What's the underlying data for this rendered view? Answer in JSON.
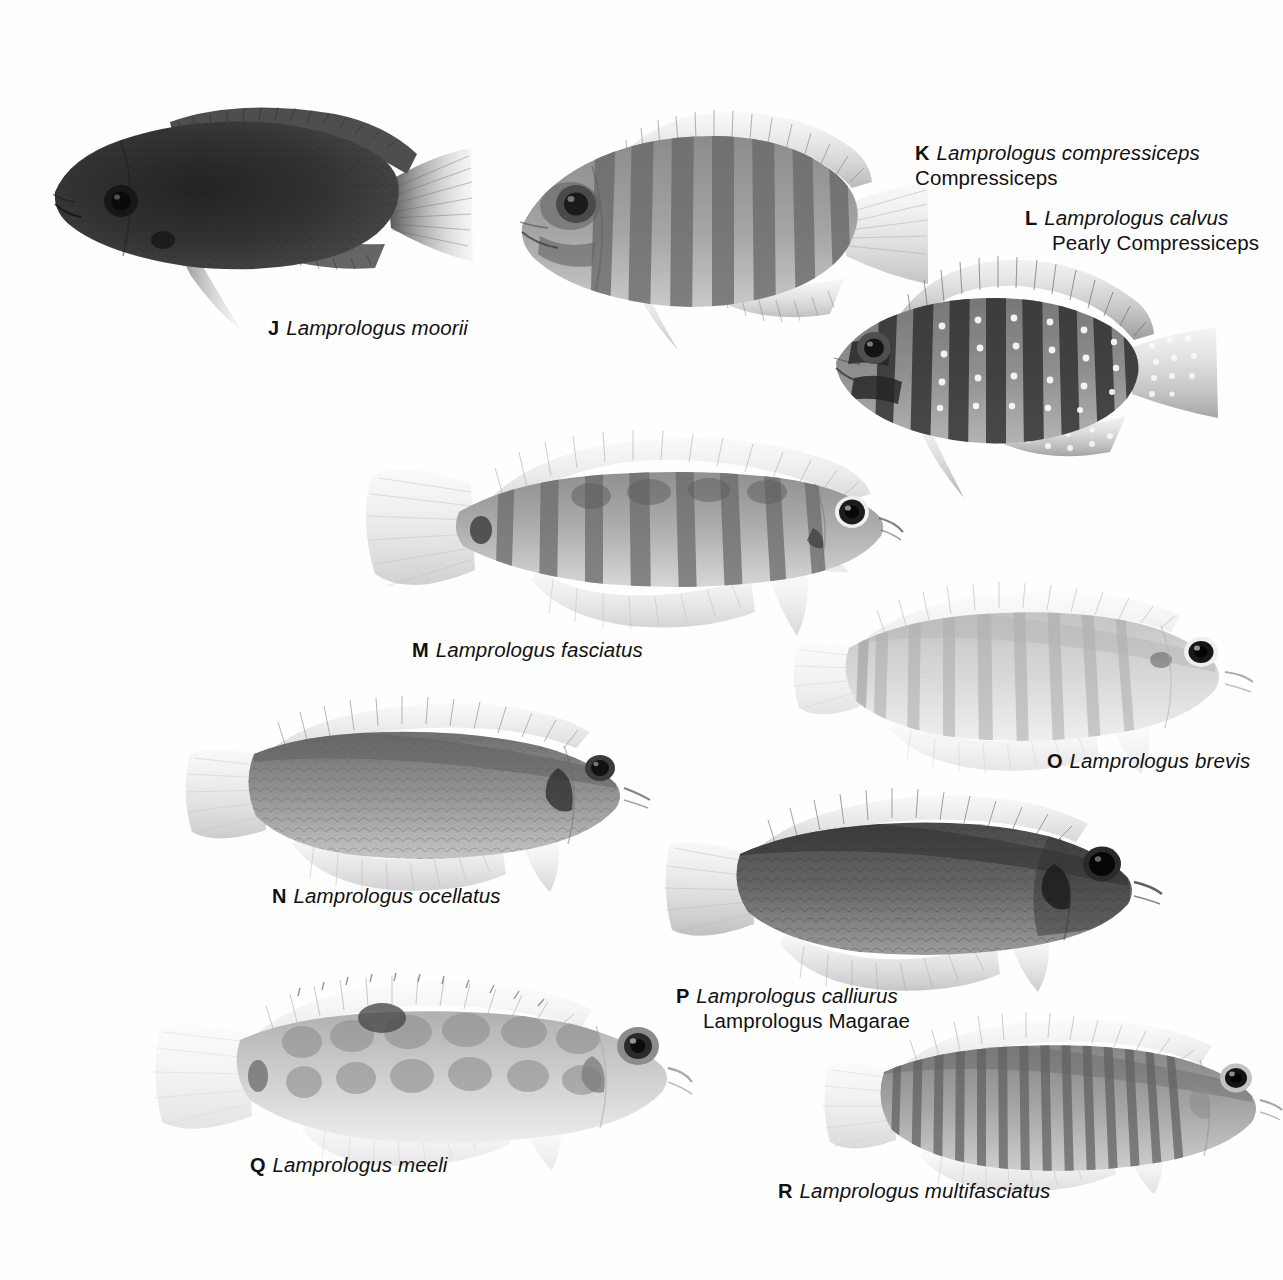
{
  "plate": {
    "background_color": "#fefefe",
    "ink_color": "#111111"
  },
  "entries": [
    {
      "letter": "J",
      "scientific_name": "Lamprologus moorii",
      "common_name": "",
      "label_x": 268,
      "label_y": 315,
      "fish": {
        "id": "fish-j",
        "x": 35,
        "y": 62,
        "width": 440,
        "height": 268,
        "facing": "left",
        "body_tone": "#3a3a3a",
        "pattern": "solid-dark",
        "bars": 0
      }
    },
    {
      "letter": "K",
      "scientific_name": "Lamprologus compressiceps",
      "common_name": "Compressiceps",
      "label_x": 915,
      "label_y": 140,
      "fish": {
        "id": "fish-k",
        "x": 500,
        "y": 78,
        "width": 430,
        "height": 270,
        "facing": "left",
        "body_tone": "#8e8e8e",
        "pattern": "broad-bars",
        "bars": 8
      }
    },
    {
      "letter": "L",
      "scientific_name": "Lamprologus calvus",
      "common_name": "Pearly Compressiceps",
      "label_x": 1025,
      "label_y": 205,
      "fish": {
        "id": "fish-l",
        "x": 822,
        "y": 250,
        "width": 435,
        "height": 250,
        "facing": "left",
        "body_tone": "#707070",
        "pattern": "bars-with-pearl-spots",
        "bars": 9
      }
    },
    {
      "letter": "M",
      "scientific_name": "Lamprologus fasciatus",
      "common_name": "",
      "label_x": 412,
      "label_y": 637,
      "fish": {
        "id": "fish-m",
        "x": 363,
        "y": 422,
        "width": 540,
        "height": 215,
        "facing": "right",
        "body_tone": "#a6a6a6",
        "pattern": "narrow-bars",
        "bars": 9
      }
    },
    {
      "letter": "N",
      "scientific_name": "Lamprologus ocellatus",
      "common_name": "",
      "label_x": 272,
      "label_y": 883,
      "fish": {
        "id": "fish-n",
        "x": 172,
        "y": 692,
        "width": 480,
        "height": 200,
        "facing": "right",
        "body_tone": "#8a8a8a",
        "pattern": "scaled-plain",
        "bars": 0
      }
    },
    {
      "letter": "O",
      "scientific_name": "Lamprologus brevis",
      "common_name": "",
      "label_x": 1047,
      "label_y": 748,
      "fish": {
        "id": "fish-o",
        "x": 793,
        "y": 572,
        "width": 460,
        "height": 200,
        "facing": "right",
        "body_tone": "#d2d2d2",
        "pattern": "faint-bars",
        "bars": 9
      }
    },
    {
      "letter": "P",
      "scientific_name": "Lamprologus calliurus",
      "common_name": "Lamprologus Magarae",
      "label_x": 676,
      "label_y": 983,
      "fish": {
        "id": "fish-p",
        "x": 662,
        "y": 782,
        "width": 500,
        "height": 210,
        "facing": "right",
        "body_tone": "#5e5e5e",
        "pattern": "scaled-dark",
        "bars": 0
      }
    },
    {
      "letter": "Q",
      "scientific_name": "Lamprologus meeli",
      "common_name": "",
      "label_x": 250,
      "label_y": 1152,
      "fish": {
        "id": "fish-q",
        "x": 152,
        "y": 972,
        "width": 540,
        "height": 195,
        "facing": "right",
        "body_tone": "#c2c2c2",
        "pattern": "mottled-blotches",
        "bars": 6
      }
    },
    {
      "letter": "R",
      "scientific_name": "Lamprologus multifasciatus",
      "common_name": "",
      "label_x": 778,
      "label_y": 1178,
      "fish": {
        "id": "fish-r",
        "x": 822,
        "y": 1012,
        "width": 460,
        "height": 180,
        "facing": "right",
        "body_tone": "#9a9a9a",
        "pattern": "many-narrow-bars",
        "bars": 14
      }
    }
  ]
}
